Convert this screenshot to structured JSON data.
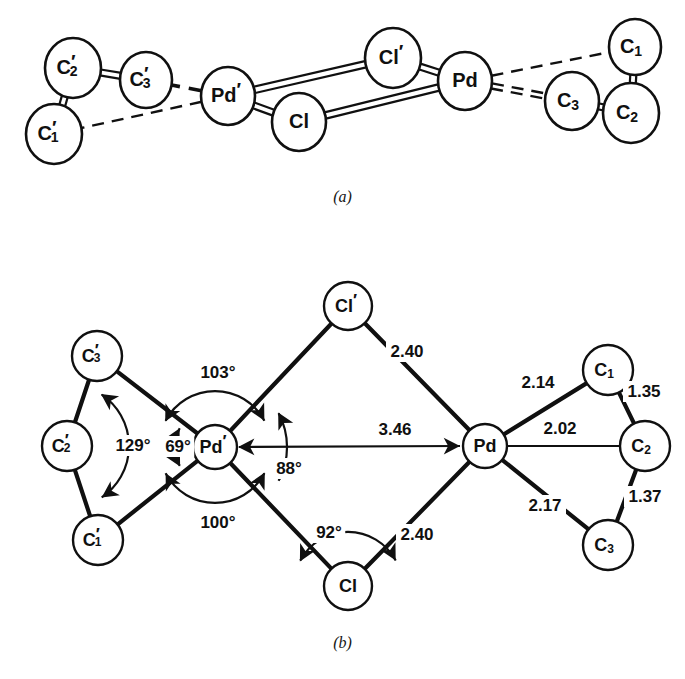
{
  "figure": {
    "caption_a": "(a)",
    "caption_b": "(b)",
    "ink_color": "#101010",
    "background_color": "#ffffff"
  },
  "panel_a": {
    "name": "perspective-view",
    "atoms": [
      {
        "id": "C2p_a",
        "label": "C",
        "sub": "2",
        "prime": true,
        "cx": 73,
        "cy": 68,
        "rx": 28,
        "ry": 30
      },
      {
        "id": "C3p_a",
        "label": "C",
        "sub": "3",
        "prime": true,
        "cx": 146,
        "cy": 80,
        "rx": 26,
        "ry": 28
      },
      {
        "id": "C1p_a",
        "label": "C",
        "sub": "1",
        "prime": true,
        "cx": 54,
        "cy": 134,
        "rx": 28,
        "ry": 30
      },
      {
        "id": "Pdp_a",
        "label": "Pd",
        "sub": "",
        "prime": true,
        "cx": 228,
        "cy": 96,
        "rx": 27,
        "ry": 29
      },
      {
        "id": "Cl_a",
        "label": "Cl",
        "sub": "",
        "prime": false,
        "cx": 299,
        "cy": 122,
        "rx": 27,
        "ry": 29
      },
      {
        "id": "Clp_a",
        "label": "Cl",
        "sub": "",
        "prime": true,
        "cx": 393,
        "cy": 58,
        "rx": 28,
        "ry": 30
      },
      {
        "id": "Pd_a",
        "label": "Pd",
        "sub": "",
        "prime": false,
        "cx": 465,
        "cy": 81,
        "rx": 27,
        "ry": 29
      },
      {
        "id": "C1_a",
        "label": "C",
        "sub": "1",
        "prime": false,
        "cx": 635,
        "cy": 47,
        "rx": 26,
        "ry": 28
      },
      {
        "id": "C3_a",
        "label": "C",
        "sub": "3",
        "prime": false,
        "cx": 572,
        "cy": 101,
        "rx": 27,
        "ry": 29
      },
      {
        "id": "C2_a",
        "label": "C",
        "sub": "2",
        "prime": false,
        "cx": 631,
        "cy": 113,
        "rx": 28,
        "ry": 30
      }
    ],
    "bond_styles": {
      "double_solid": "C-C double-line bond",
      "bridge": "Pd-Cl bridging double-line bond",
      "dashed": "Pd-C dashed contact"
    }
  },
  "panel_b": {
    "name": "metric-view",
    "atoms": [
      {
        "id": "C3p_b",
        "label": "C",
        "sub": "3",
        "prime": true,
        "cx": 97,
        "cy": 356,
        "r": 25
      },
      {
        "id": "C2p_b",
        "label": "C",
        "sub": "2",
        "prime": true,
        "cx": 67,
        "cy": 446,
        "r": 25
      },
      {
        "id": "C1p_b",
        "label": "C",
        "sub": "1",
        "prime": true,
        "cx": 98,
        "cy": 540,
        "r": 25
      },
      {
        "id": "Pdp_b",
        "label": "Pd",
        "sub": "",
        "prime": true,
        "cx": 215,
        "cy": 447,
        "r": 22
      },
      {
        "id": "Clp_b",
        "label": "Cl",
        "sub": "",
        "prime": true,
        "cx": 348,
        "cy": 306,
        "r": 24
      },
      {
        "id": "Cl_b",
        "label": "Cl",
        "sub": "",
        "prime": false,
        "cx": 348,
        "cy": 586,
        "r": 24
      },
      {
        "id": "Pd_b",
        "label": "Pd",
        "sub": "",
        "prime": false,
        "cx": 485,
        "cy": 446,
        "r": 22
      },
      {
        "id": "C1_b",
        "label": "C",
        "sub": "1",
        "prime": false,
        "cx": 608,
        "cy": 370,
        "r": 25
      },
      {
        "id": "C2_b",
        "label": "C",
        "sub": "2",
        "prime": false,
        "cx": 645,
        "cy": 446,
        "r": 25
      },
      {
        "id": "C3_b",
        "label": "C",
        "sub": "3",
        "prime": false,
        "cx": 608,
        "cy": 545,
        "r": 25
      }
    ],
    "distances": [
      {
        "id": "d-clp-pd",
        "value": "2.40",
        "x": 407,
        "y": 352
      },
      {
        "id": "d-pdp-pd",
        "value": "3.46",
        "x": 395,
        "y": 430
      },
      {
        "id": "d-cl-pd",
        "value": "2.40",
        "x": 417,
        "y": 535
      },
      {
        "id": "d-pd-c1",
        "value": "2.14",
        "x": 538,
        "y": 383
      },
      {
        "id": "d-pd-c2",
        "value": "2.02",
        "x": 560,
        "y": 429
      },
      {
        "id": "d-pd-c3",
        "value": "2.17",
        "x": 545,
        "y": 506
      },
      {
        "id": "d-c1-c2",
        "value": "1.35",
        "x": 644,
        "y": 392
      },
      {
        "id": "d-c2-c3",
        "value": "1.37",
        "x": 645,
        "y": 497
      }
    ],
    "angles": [
      {
        "id": "a-129",
        "value": "129°",
        "x": 133,
        "y": 446
      },
      {
        "id": "a-69",
        "value": "69°",
        "x": 178,
        "y": 447
      },
      {
        "id": "a-103",
        "value": "103°",
        "x": 218,
        "y": 373
      },
      {
        "id": "a-100",
        "value": "100°",
        "x": 218,
        "y": 523
      },
      {
        "id": "a-88",
        "value": "88°",
        "x": 289,
        "y": 469
      },
      {
        "id": "a-92",
        "value": "92°",
        "x": 329,
        "y": 533
      }
    ]
  }
}
